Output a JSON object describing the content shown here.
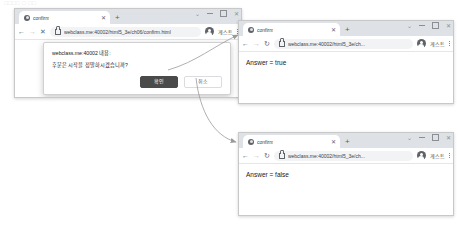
{
  "caption": {
    "text": "□□□□ □ □□"
  },
  "colors": {
    "tabstrip": "#dee1e6",
    "omnibox": "#f1f3f4",
    "ok_button_bg": "#4a4a4a",
    "cancel_button_bg": "#ffffff",
    "page_text": "#202124",
    "arrow": "#9a9a9a"
  },
  "main_window": {
    "tab": {
      "title": "confirm",
      "favicon_icon": "globe-icon",
      "close_icon": "close-icon"
    },
    "new_tab_icon": "plus-icon",
    "window_controls": {
      "chevron_icon": "chevron-down-icon",
      "minimize_icon": "minimize-icon",
      "maximize_icon": "maximize-icon",
      "close_icon": "close-icon"
    },
    "toolbar": {
      "back_icon": "arrow-left-icon",
      "forward_icon": "arrow-right-icon",
      "stop_icon": "close-icon",
      "lock_icon": "lock-icon",
      "url": "webclass.me:40002/html5_3e/ch06/confirm.html",
      "avatar_icon": "avatar-icon",
      "profile_label": "게스트",
      "menu_icon": "kebab-menu-icon"
    },
    "dialog": {
      "host_line": "webclass.me:40002 내용:",
      "message": "후문은 시작을 정말하시겠습니까?",
      "ok_label": "확인",
      "cancel_label": "취소"
    }
  },
  "true_window": {
    "tab": {
      "title": "confirm",
      "favicon_icon": "globe-icon",
      "close_icon": "close-icon"
    },
    "new_tab_icon": "plus-icon",
    "window_controls": {
      "chevron_icon": "chevron-down-icon",
      "minimize_icon": "minimize-icon",
      "maximize_icon": "maximize-icon",
      "close_icon": "close-icon"
    },
    "toolbar": {
      "back_icon": "arrow-left-icon",
      "forward_icon": "arrow-right-icon",
      "reload_icon": "reload-icon",
      "lock_icon": "lock-icon",
      "url": "webclass.me:40002/html5_3e/ch...",
      "avatar_icon": "avatar-icon",
      "profile_label": "게스트",
      "menu_icon": "kebab-menu-icon"
    },
    "body_text": "Answer = true"
  },
  "false_window": {
    "tab": {
      "title": "confirm",
      "favicon_icon": "globe-icon",
      "close_icon": "close-icon"
    },
    "new_tab_icon": "plus-icon",
    "window_controls": {
      "chevron_icon": "chevron-down-icon",
      "minimize_icon": "minimize-icon",
      "maximize_icon": "maximize-icon",
      "close_icon": "close-icon"
    },
    "toolbar": {
      "back_icon": "arrow-left-icon",
      "forward_icon": "arrow-right-icon",
      "reload_icon": "reload-icon",
      "lock_icon": "lock-icon",
      "url": "webclass.me:40002/html5_3e/ch...",
      "avatar_icon": "avatar-icon",
      "profile_label": "게스트",
      "menu_icon": "kebab-menu-icon"
    },
    "body_text": "Answer = false"
  },
  "annotations": {
    "ok_to_true_arrow": "arrow-ok-to-true",
    "cancel_to_false_arrow": "arrow-cancel-to-false"
  }
}
